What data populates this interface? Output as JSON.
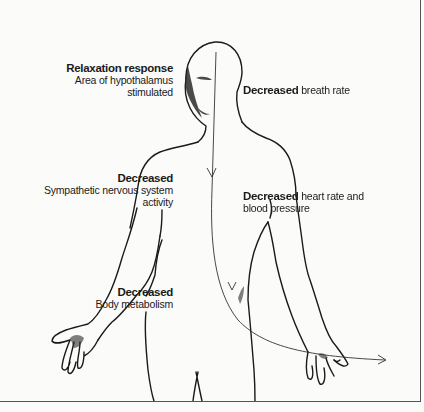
{
  "diagram": {
    "type": "anatomical illustration",
    "labels": [
      {
        "id": "relaxation",
        "heading": "Relaxation response",
        "lines": [
          "Area of hypothalamus",
          "stimulated"
        ]
      },
      {
        "id": "breath",
        "heading": "Decreased",
        "text": "breath rate"
      },
      {
        "id": "sympathetic",
        "heading": "Decreased",
        "lines": [
          "Sympathetic nervous system",
          "activity"
        ]
      },
      {
        "id": "heart",
        "heading": "Decreased",
        "text": "heart rate and",
        "line2": "blood pressure"
      },
      {
        "id": "metabolism",
        "heading": "Decreased",
        "lines": [
          "Body metabolism"
        ]
      }
    ],
    "arrow": {
      "description": "thin line from head down the body midline, curving out right past the hand",
      "direction": "downward then right"
    },
    "colors": {
      "ink": "#1a1a1a",
      "paper": "#fbfbfa",
      "frame": "#555555"
    }
  }
}
